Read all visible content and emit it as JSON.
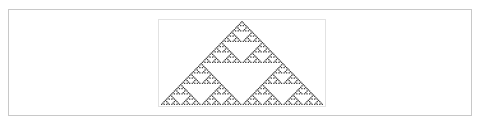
{
  "figure": {
    "description": "Sierpinski triangle pattern generated by elementary cellular automaton",
    "rule": 90,
    "rows": 64,
    "cell_color": "#3a3a3a",
    "background_color": "#ffffff",
    "outer_border_color": "#c8c8c8",
    "inner_border_color": "#e2e2e2"
  }
}
